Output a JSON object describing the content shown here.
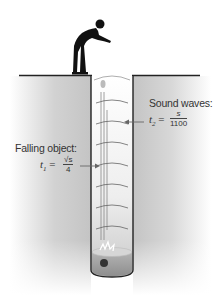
{
  "diagram": {
    "type": "illustration",
    "labels": {
      "sound_waves": {
        "title": "Sound waves:",
        "variable": "t",
        "subscript": "2",
        "equals": "=",
        "numerator": "s",
        "denominator": "1100"
      },
      "falling_object": {
        "title": "Falling object:",
        "variable": "t",
        "subscript": "1",
        "equals": "=",
        "numerator": "√s",
        "denominator": "4"
      }
    },
    "elements": [
      "person-silhouette",
      "ground",
      "well-shaft",
      "sound-wave-arcs",
      "falling-object-trail",
      "water-surface",
      "rock"
    ],
    "colors": {
      "ground_shade": "#bdbdbd",
      "well_fill": "#e8e8e8",
      "water": "#a8a8a8",
      "outline": "#222222",
      "silhouette": "#111111"
    }
  }
}
